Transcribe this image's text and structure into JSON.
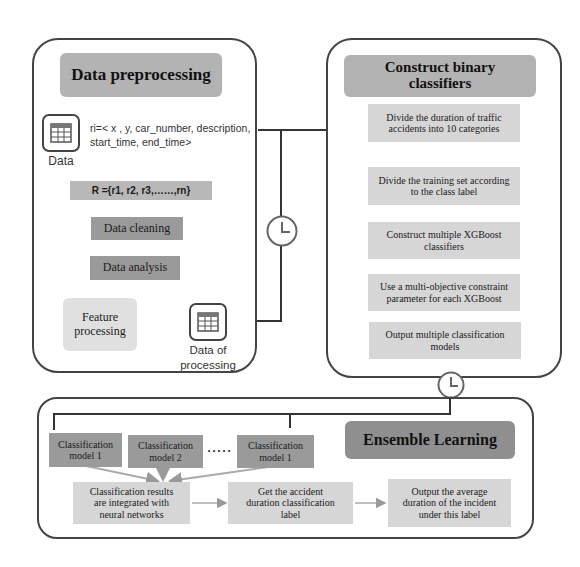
{
  "preprocessing": {
    "title": "Data preprocessing",
    "data_icon": "table-icon",
    "data_label": "Data",
    "record_line1": "ri=< x , y, car_number, description,",
    "record_line2": "start_time, end_time>",
    "set_label": "R ={r1, r2, r3,……,rn}",
    "cleaning": "Data cleaning",
    "analysis": "Data analysis",
    "feature_line1": "Feature",
    "feature_line2": "processing",
    "output_icon": "table-icon",
    "output_line1": "Data of",
    "output_line2": "processing"
  },
  "connector": {
    "clock_icon": "clock-icon"
  },
  "binary": {
    "title_line1": "Construct  binary",
    "title_line2": "classifiers",
    "steps": [
      {
        "line1": "Divide the duration of traffic",
        "line2": "accidents into 10 categories"
      },
      {
        "line1": "Divide the training set according",
        "line2": "to the class label"
      },
      {
        "line1": "Construct multiple XGBoost",
        "line2": "classifiers"
      },
      {
        "line1": "Use a multi-objective constraint",
        "line2": "parameter for each XGBoost"
      },
      {
        "line1": "Output multiple classification",
        "line2": "models"
      }
    ]
  },
  "ensemble": {
    "title": "Ensemble Learning",
    "models": [
      {
        "line1": "Classification",
        "line2": "model 1"
      },
      {
        "line1": "Classification",
        "line2": "model 2"
      },
      {
        "line1": "Classification",
        "line2": "model 1"
      }
    ],
    "ellipsis": "·····",
    "integrate": {
      "line1": "Classification results",
      "line2": "are integrated with",
      "line3": "neural networks"
    },
    "get_label": {
      "line1": "Get the accident",
      "line2": "duration classification",
      "line3": "label"
    },
    "output": {
      "line1": "Output the average",
      "line2": "duration of the incident",
      "line3": "under this label"
    }
  }
}
